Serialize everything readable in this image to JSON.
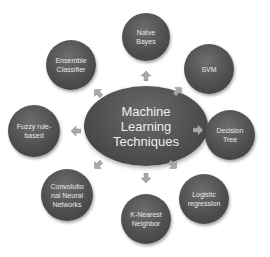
{
  "diagram": {
    "center": {
      "label": "Machine\nLearning\nTechniques"
    },
    "nodes": [
      {
        "id": "naive-bayes",
        "label": "Naïve\nBayes"
      },
      {
        "id": "svm",
        "label": "SVM"
      },
      {
        "id": "decision-tree",
        "label": "Decision\nTree"
      },
      {
        "id": "logistic-regression",
        "label": "Logistic\nregression"
      },
      {
        "id": "k-nearest-neighbor",
        "label": "K-Nearest\nNeighbor"
      },
      {
        "id": "cnn",
        "label": "Convolutio\nnal Neural\nNetworks"
      },
      {
        "id": "fuzzy-rule-based",
        "label": "Fuzzy rule-\nbased"
      },
      {
        "id": "ensemble-classifier",
        "label": "Ensemble\nClassifier"
      }
    ],
    "colors": {
      "node_fill": "#4f4f4f",
      "text": "#e9e9e9",
      "arrow": "#a8a8a8"
    }
  }
}
